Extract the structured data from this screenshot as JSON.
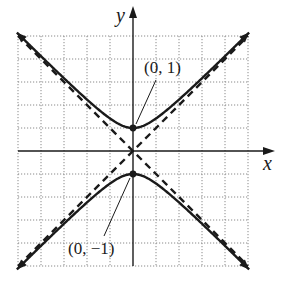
{
  "chart_data": {
    "type": "line",
    "title": "",
    "equation": "y^2 - x^2 = 1",
    "xlabel": "x",
    "ylabel": "y",
    "xlim": [
      -5,
      5
    ],
    "ylim": [
      -5,
      5
    ],
    "grid": true,
    "grid_style": "dotted",
    "series": [
      {
        "name": "hyperbola upper branch",
        "style": "solid",
        "arrows": true,
        "x": [
          -5,
          -4,
          -3,
          -2,
          -1,
          0,
          1,
          2,
          3,
          4,
          5
        ],
        "y": [
          5.1,
          4.12,
          3.16,
          2.24,
          1.41,
          1,
          1.41,
          2.24,
          3.16,
          4.12,
          5.1
        ]
      },
      {
        "name": "hyperbola lower branch",
        "style": "solid",
        "arrows": true,
        "x": [
          -5,
          -4,
          -3,
          -2,
          -1,
          0,
          1,
          2,
          3,
          4,
          5
        ],
        "y": [
          -5.1,
          -4.12,
          -3.16,
          -2.24,
          -1.41,
          -1,
          -1.41,
          -2.24,
          -3.16,
          -4.12,
          -5.1
        ]
      },
      {
        "name": "asymptote y = x",
        "style": "dashed",
        "x": [
          -5,
          5
        ],
        "y": [
          -5,
          5
        ]
      },
      {
        "name": "asymptote y = -x",
        "style": "dashed",
        "x": [
          -5,
          5
        ],
        "y": [
          5,
          -5
        ]
      }
    ],
    "points": [
      {
        "x": 0,
        "y": 1,
        "label": "(0, 1)"
      },
      {
        "x": 0,
        "y": -1,
        "label": "(0, −1)"
      }
    ],
    "annotations": [
      "(0, 1)",
      "(0, −1)"
    ]
  },
  "labels": {
    "x_axis": "x",
    "y_axis": "y",
    "vertex_top": "(0, 1)",
    "vertex_bottom": "(0, −1)"
  },
  "colors": {
    "ink": "#1a1a1a",
    "grid": "#8a8a8a",
    "background": "#ffffff"
  }
}
